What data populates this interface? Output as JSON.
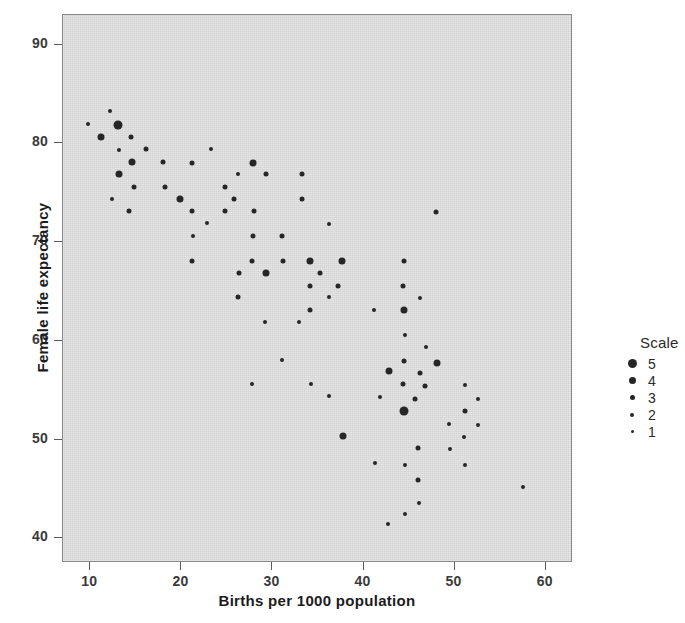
{
  "figure": {
    "background_color": "#ffffff",
    "panel_color": "#d9d9d9",
    "point_color": "#262626"
  },
  "axes": {
    "xlabel": "Births per 1000 population",
    "ylabel": "Female life expectancy",
    "x_ticks": [
      10,
      20,
      30,
      40,
      50,
      60
    ],
    "y_ticks": [
      40,
      50,
      60,
      70,
      80,
      90
    ]
  },
  "legend": {
    "title": "Scale",
    "entries": [
      {
        "label": "5",
        "size": 9
      },
      {
        "label": "4",
        "size": 7
      },
      {
        "label": "3",
        "size": 5
      },
      {
        "label": "2",
        "size": 4
      },
      {
        "label": "1",
        "size": 3
      }
    ]
  },
  "chart_data": {
    "type": "scatter",
    "title": "",
    "xlabel": "Births per 1000 population",
    "ylabel": "Female life expectancy",
    "xlim": [
      7,
      63
    ],
    "ylim": [
      37.5,
      93
    ],
    "grid": false,
    "legend_position": "right",
    "size_legend": {
      "title": "Scale",
      "levels": [
        5,
        4,
        3,
        2,
        1
      ],
      "marker_px": [
        9,
        7,
        5,
        4,
        3
      ]
    },
    "series": [
      {
        "name": "countries",
        "size_key": "Scale",
        "points": [
          {
            "x": 9.7,
            "y": 82.0,
            "s": 2
          },
          {
            "x": 12.2,
            "y": 83.3,
            "s": 2
          },
          {
            "x": 13.0,
            "y": 81.9,
            "s": 5
          },
          {
            "x": 11.2,
            "y": 80.6,
            "s": 4
          },
          {
            "x": 14.5,
            "y": 80.6,
            "s": 3
          },
          {
            "x": 13.1,
            "y": 79.3,
            "s": 2
          },
          {
            "x": 16.1,
            "y": 79.4,
            "s": 3
          },
          {
            "x": 23.2,
            "y": 79.4,
            "s": 2
          },
          {
            "x": 14.6,
            "y": 78.1,
            "s": 4
          },
          {
            "x": 18.0,
            "y": 78.1,
            "s": 3
          },
          {
            "x": 21.2,
            "y": 78.0,
            "s": 3
          },
          {
            "x": 27.9,
            "y": 78.0,
            "s": 4
          },
          {
            "x": 13.1,
            "y": 76.9,
            "s": 4
          },
          {
            "x": 26.2,
            "y": 76.9,
            "s": 2
          },
          {
            "x": 29.3,
            "y": 76.9,
            "s": 3
          },
          {
            "x": 33.2,
            "y": 76.9,
            "s": 3
          },
          {
            "x": 14.8,
            "y": 75.6,
            "s": 3
          },
          {
            "x": 18.2,
            "y": 75.6,
            "s": 3
          },
          {
            "x": 24.8,
            "y": 75.6,
            "s": 3
          },
          {
            "x": 12.4,
            "y": 74.4,
            "s": 2
          },
          {
            "x": 19.8,
            "y": 74.4,
            "s": 4
          },
          {
            "x": 25.8,
            "y": 74.4,
            "s": 3
          },
          {
            "x": 33.2,
            "y": 74.4,
            "s": 3
          },
          {
            "x": 14.2,
            "y": 73.1,
            "s": 3
          },
          {
            "x": 21.2,
            "y": 73.1,
            "s": 3
          },
          {
            "x": 24.8,
            "y": 73.1,
            "s": 3
          },
          {
            "x": 28.0,
            "y": 73.1,
            "s": 3
          },
          {
            "x": 48.0,
            "y": 73.0,
            "s": 3
          },
          {
            "x": 22.8,
            "y": 71.9,
            "s": 2
          },
          {
            "x": 36.2,
            "y": 71.8,
            "s": 2
          },
          {
            "x": 21.3,
            "y": 70.6,
            "s": 2
          },
          {
            "x": 27.9,
            "y": 70.6,
            "s": 3
          },
          {
            "x": 31.1,
            "y": 70.6,
            "s": 3
          },
          {
            "x": 21.2,
            "y": 68.1,
            "s": 3
          },
          {
            "x": 27.8,
            "y": 68.1,
            "s": 3
          },
          {
            "x": 31.2,
            "y": 68.1,
            "s": 3
          },
          {
            "x": 34.1,
            "y": 68.1,
            "s": 4
          },
          {
            "x": 37.6,
            "y": 68.1,
            "s": 4
          },
          {
            "x": 44.4,
            "y": 68.1,
            "s": 3
          },
          {
            "x": 26.3,
            "y": 66.9,
            "s": 3
          },
          {
            "x": 29.3,
            "y": 66.9,
            "s": 4
          },
          {
            "x": 35.2,
            "y": 66.9,
            "s": 3
          },
          {
            "x": 34.1,
            "y": 65.6,
            "s": 3
          },
          {
            "x": 37.2,
            "y": 65.6,
            "s": 3
          },
          {
            "x": 44.3,
            "y": 65.6,
            "s": 3
          },
          {
            "x": 26.2,
            "y": 64.4,
            "s": 3
          },
          {
            "x": 36.2,
            "y": 64.4,
            "s": 2
          },
          {
            "x": 46.2,
            "y": 64.3,
            "s": 2
          },
          {
            "x": 34.1,
            "y": 63.1,
            "s": 3
          },
          {
            "x": 41.2,
            "y": 63.1,
            "s": 2
          },
          {
            "x": 44.4,
            "y": 63.1,
            "s": 4
          },
          {
            "x": 29.2,
            "y": 61.9,
            "s": 2
          },
          {
            "x": 32.9,
            "y": 61.9,
            "s": 2
          },
          {
            "x": 44.5,
            "y": 60.6,
            "s": 2
          },
          {
            "x": 46.9,
            "y": 59.4,
            "s": 2
          },
          {
            "x": 31.1,
            "y": 58.1,
            "s": 2
          },
          {
            "x": 44.4,
            "y": 58.0,
            "s": 3
          },
          {
            "x": 48.1,
            "y": 57.8,
            "s": 4
          },
          {
            "x": 42.8,
            "y": 56.9,
            "s": 4
          },
          {
            "x": 46.2,
            "y": 56.7,
            "s": 3
          },
          {
            "x": 27.8,
            "y": 55.6,
            "s": 2
          },
          {
            "x": 34.2,
            "y": 55.6,
            "s": 2
          },
          {
            "x": 44.3,
            "y": 55.6,
            "s": 3
          },
          {
            "x": 46.8,
            "y": 55.4,
            "s": 3
          },
          {
            "x": 51.1,
            "y": 55.5,
            "s": 2
          },
          {
            "x": 36.2,
            "y": 54.4,
            "s": 2
          },
          {
            "x": 41.8,
            "y": 54.3,
            "s": 2
          },
          {
            "x": 45.6,
            "y": 54.1,
            "s": 3
          },
          {
            "x": 52.6,
            "y": 54.1,
            "s": 2
          },
          {
            "x": 44.4,
            "y": 52.9,
            "s": 5
          },
          {
            "x": 51.1,
            "y": 52.9,
            "s": 3
          },
          {
            "x": 49.4,
            "y": 51.6,
            "s": 2
          },
          {
            "x": 52.6,
            "y": 51.5,
            "s": 2
          },
          {
            "x": 37.7,
            "y": 50.4,
            "s": 4
          },
          {
            "x": 51.0,
            "y": 50.3,
            "s": 2
          },
          {
            "x": 46.0,
            "y": 49.1,
            "s": 3
          },
          {
            "x": 49.5,
            "y": 49.0,
            "s": 2
          },
          {
            "x": 41.3,
            "y": 47.6,
            "s": 2
          },
          {
            "x": 44.5,
            "y": 47.4,
            "s": 2
          },
          {
            "x": 51.1,
            "y": 47.4,
            "s": 2
          },
          {
            "x": 57.5,
            "y": 45.2,
            "s": 2
          },
          {
            "x": 46.0,
            "y": 45.9,
            "s": 3
          },
          {
            "x": 46.1,
            "y": 43.6,
            "s": 2
          },
          {
            "x": 44.6,
            "y": 42.5,
            "s": 2
          },
          {
            "x": 42.7,
            "y": 41.5,
            "s": 2
          }
        ]
      }
    ]
  }
}
